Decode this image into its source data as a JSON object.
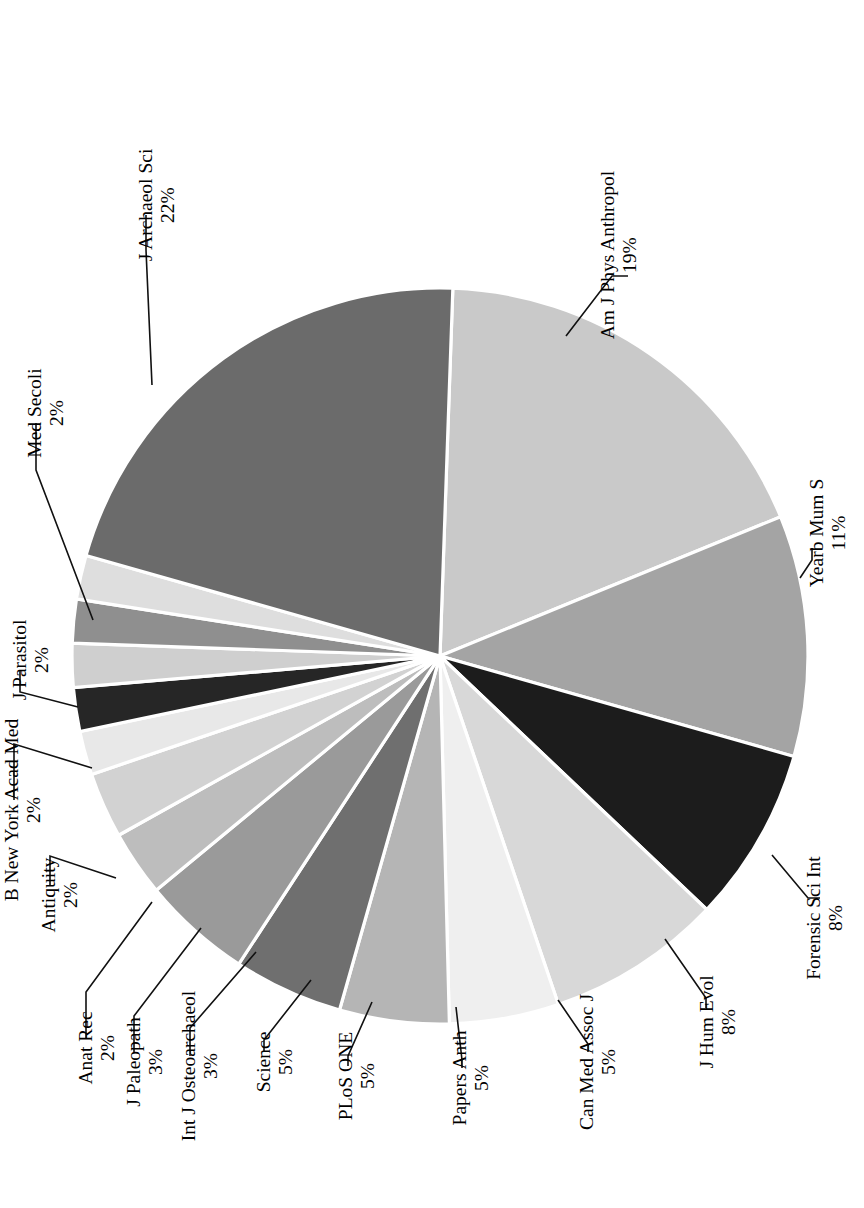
{
  "chart_data": {
    "type": "pie",
    "title": "",
    "subtitle": "",
    "xlabel": "",
    "ylabel": "",
    "legend_position": "none",
    "grid": false,
    "labels_rotated_degrees": -90,
    "value_unit": "%",
    "categories": [
      "Am J Phys Anthropol",
      "Yearb Mum S",
      "Forensic Sci Int",
      "J Hum Evol",
      "Can Med Assoc J",
      "Papers Anth",
      "PLoS ONE",
      "Science",
      "Int J Osteoarchaeol",
      "J Paleopath",
      "Anat Rec",
      "Antiquity",
      "B New York Acad Med",
      "J Parasitol",
      "Med Secoli",
      "J Archaeol Sci"
    ],
    "values": [
      19,
      11,
      8,
      8,
      5,
      5,
      5,
      5,
      3,
      3,
      2,
      2,
      2,
      2,
      2,
      22
    ],
    "value_labels": [
      "19%",
      "11%",
      "8%",
      "8%",
      "5%",
      "5%",
      "5%",
      "5%",
      "3%",
      "3%",
      "2%",
      "2%",
      "2%",
      "2%",
      "2%",
      "22%"
    ],
    "slice_colors": [
      "#c9c9c9",
      "#a4a4a4",
      "#1c1c1c",
      "#d8d8d8",
      "#efefef",
      "#b5b5b5",
      "#6f6f6f",
      "#9a9a9a",
      "#bdbdbd",
      "#d2d2d2",
      "#e8e8e8",
      "#262626",
      "#cfcfcf",
      "#8f8f8f",
      "#dedede",
      "#6b6b6b"
    ],
    "slices": [
      {
        "label": "Am J Phys Anthropol",
        "value": 19,
        "value_label": "19%",
        "color": "#c9c9c9"
      },
      {
        "label": "Yearb Mum S",
        "value": 11,
        "value_label": "11%",
        "color": "#a4a4a4"
      },
      {
        "label": "Forensic Sci Int",
        "value": 8,
        "value_label": "8%",
        "color": "#1c1c1c"
      },
      {
        "label": "J Hum Evol",
        "value": 8,
        "value_label": "8%",
        "color": "#d8d8d8"
      },
      {
        "label": "Can Med Assoc J",
        "value": 5,
        "value_label": "5%",
        "color": "#efefef"
      },
      {
        "label": "Papers Anth",
        "value": 5,
        "value_label": "5%",
        "color": "#b5b5b5"
      },
      {
        "label": "PLoS ONE",
        "value": 5,
        "value_label": "5%",
        "color": "#6f6f6f"
      },
      {
        "label": "Science",
        "value": 5,
        "value_label": "5%",
        "color": "#9a9a9a"
      },
      {
        "label": "Int J Osteoarchaeol",
        "value": 3,
        "value_label": "3%",
        "color": "#bdbdbd"
      },
      {
        "label": "J Paleopath",
        "value": 3,
        "value_label": "3%",
        "color": "#d2d2d2"
      },
      {
        "label": "Anat Rec",
        "value": 2,
        "value_label": "2%",
        "color": "#e8e8e8"
      },
      {
        "label": "Antiquity",
        "value": 2,
        "value_label": "2%",
        "color": "#262626"
      },
      {
        "label": "B New York Acad Med",
        "value": 2,
        "value_label": "2%",
        "color": "#cfcfcf"
      },
      {
        "label": "J Parasitol",
        "value": 2,
        "value_label": "2%",
        "color": "#8f8f8f"
      },
      {
        "label": "Med Secoli",
        "value": 2,
        "value_label": "2%",
        "color": "#dedede"
      },
      {
        "label": "J Archaeol Sci",
        "value": 22,
        "value_label": "22%",
        "color": "#6b6b6b"
      }
    ]
  },
  "geometry": {
    "center_x": 440,
    "center_y": 656,
    "radius": 368,
    "start_angle_deg": -88
  },
  "label_layout": [
    {
      "name": "Am J Phys Anthropol",
      "tx": 614,
      "ty": 255,
      "px": 636,
      "py": 255,
      "elbow": [
        [
          566,
          336
        ],
        [
          612,
          276
        ],
        [
          628,
          276
        ]
      ]
    },
    {
      "name": "Yearb Mum S",
      "tx": 823,
      "ty": 533,
      "px": 845,
      "py": 533,
      "elbow": [
        [
          800,
          578
        ],
        [
          812,
          560
        ],
        [
          812,
          548
        ]
      ]
    },
    {
      "name": "Forensic Sci Int",
      "tx": 820,
      "ty": 918,
      "px": 842,
      "py": 918,
      "elbow": [
        [
          772,
          855
        ],
        [
          808,
          898
        ],
        [
          820,
          898
        ]
      ]
    },
    {
      "name": "J Hum Evol",
      "tx": 713,
      "ty": 1022,
      "px": 735,
      "py": 1022,
      "elbow": [
        [
          665,
          939
        ],
        [
          706,
          998
        ],
        [
          706,
          1008
        ]
      ]
    },
    {
      "name": "Can Med Assoc J",
      "tx": 593,
      "ty": 1062,
      "px": 615,
      "py": 1062,
      "elbow": [
        [
          558,
          1000
        ],
        [
          588,
          1044
        ],
        [
          588,
          1052
        ]
      ]
    },
    {
      "name": "Papers Anth",
      "tx": 466,
      "ty": 1078,
      "px": 488,
      "py": 1078,
      "elbow": [
        [
          456,
          1007
        ],
        [
          462,
          1060
        ],
        [
          462,
          1068
        ]
      ]
    },
    {
      "name": "PLoS ONE",
      "tx": 352,
      "ty": 1076,
      "px": 374,
      "py": 1076,
      "elbow": [
        [
          372,
          1002
        ],
        [
          348,
          1056
        ],
        [
          348,
          1066
        ]
      ]
    },
    {
      "name": "Science",
      "tx": 270,
      "ty": 1062,
      "px": 292,
      "py": 1062,
      "elbow": [
        [
          311,
          980
        ],
        [
          264,
          1040
        ],
        [
          264,
          1052
        ]
      ]
    },
    {
      "name": "Int J Osteoarchaeol",
      "tx": 195,
      "ty": 1066,
      "px": 217,
      "py": 1066,
      "elbow": [
        [
          256,
          952
        ],
        [
          190,
          1028
        ],
        [
          190,
          1056
        ]
      ]
    },
    {
      "name": "J Paleopath",
      "tx": 140,
      "ty": 1062,
      "px": 162,
      "py": 1062,
      "elbow": [
        [
          201,
          928
        ],
        [
          134,
          1016
        ],
        [
          134,
          1052
        ]
      ]
    },
    {
      "name": "Anat Rec",
      "tx": 92,
      "ty": 1048,
      "px": 114,
      "py": 1048,
      "elbow": [
        [
          152,
          902
        ],
        [
          86,
          992
        ],
        [
          86,
          1038
        ]
      ]
    },
    {
      "name": "Antiquity",
      "tx": 55,
      "ty": 895,
      "px": 77,
      "py": 895,
      "elbow": [
        [
          116,
          878
        ],
        [
          50,
          856
        ],
        [
          50,
          885
        ]
      ]
    },
    {
      "name": "B New York Acad Med",
      "tx": 18,
      "ty": 810,
      "px": 40,
      "py": 810,
      "elbow": [
        [
          92,
          768
        ],
        [
          14,
          744
        ],
        [
          14,
          800
        ]
      ]
    },
    {
      "name": "J Parasitol",
      "tx": 26,
      "ty": 660,
      "px": 48,
      "py": 660,
      "elbow": [
        [
          78,
          707
        ],
        [
          20,
          692
        ],
        [
          20,
          670
        ]
      ]
    },
    {
      "name": "Med Secoli",
      "tx": 41,
      "ty": 413,
      "px": 63,
      "py": 413,
      "elbow": [
        [
          93,
          620
        ],
        [
          36,
          470
        ],
        [
          36,
          423
        ]
      ]
    },
    {
      "name": "J Archaeol Sci",
      "tx": 152,
      "ty": 205,
      "px": 174,
      "py": 205,
      "elbow": [
        [
          152,
          385
        ],
        [
          146,
          250
        ],
        [
          146,
          215
        ]
      ]
    }
  ]
}
